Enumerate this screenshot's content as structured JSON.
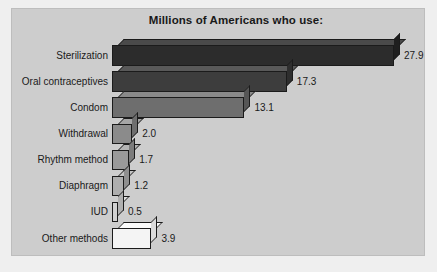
{
  "chart_data": {
    "type": "bar",
    "orientation": "horizontal",
    "title": "Millions of Americans who use:",
    "xlabel": "",
    "ylabel": "",
    "xlim": [
      0,
      27.9
    ],
    "grid": false,
    "legend": "none",
    "value_labels": true,
    "units": "millions of Americans",
    "categories": [
      "Sterilization",
      "Oral contraceptives",
      "Condom",
      "Withdrawal",
      "Rhythm method",
      "Diaphragm",
      "IUD",
      "Other methods"
    ],
    "values": [
      27.9,
      17.3,
      13.1,
      2.0,
      1.7,
      1.2,
      0.5,
      3.9
    ],
    "value_label_text": [
      "27.9",
      "17.3",
      "13.1",
      "2.0",
      "1.7",
      "1.2",
      "0.5",
      "3.9"
    ],
    "bar_colors": [
      "#2c2c2c",
      "#3d3d3d",
      "#6e6e6e",
      "#8b8b8b",
      "#9a9a9a",
      "#aeaeae",
      "#d0d0d0",
      "#f4f4f4"
    ],
    "bar_top_colors": [
      "#4a4a4a",
      "#595959",
      "#8a8a8a",
      "#a6a6a6",
      "#b4b4b4",
      "#c4c4c4",
      "#e0e0e0",
      "#fbfbfb"
    ],
    "bar_side_colors": [
      "#1f1f1f",
      "#2e2e2e",
      "#565656",
      "#6e6e6e",
      "#7c7c7c",
      "#8f8f8f",
      "#b0b0b0",
      "#dcdcdc"
    ]
  },
  "figure": {
    "background_color": "#efefef",
    "panel_color": "#cdcdcd",
    "panel_border_color": "#bdbdbd",
    "text_color": "#1a1a1a"
  }
}
